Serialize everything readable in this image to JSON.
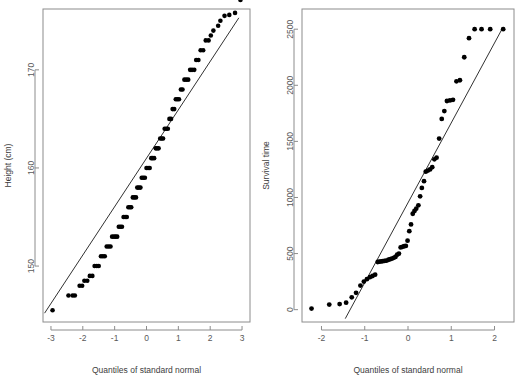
{
  "figure": {
    "background": "#ffffff",
    "point_color": "#000000",
    "axis_color": "#8c8c8c",
    "line_color": "#1a1a1a",
    "panels": 2
  },
  "chart_data": [
    {
      "type": "scatter",
      "name": "height-qqplot",
      "title": "",
      "xlabel": "Quantiles of standard normal",
      "ylabel": "Height (cm)",
      "xlim": [
        -3.25,
        3.25
      ],
      "ylim": [
        144.3,
        176.2
      ],
      "xticks": [
        -3,
        -2,
        -1,
        0,
        1,
        2,
        3
      ],
      "xticklabels": [
        "-3",
        "-2",
        "-1",
        "0",
        "1",
        "2",
        "3"
      ],
      "yticks": [
        150,
        160,
        170
      ],
      "yticklabels": [
        "150",
        "160",
        "170"
      ],
      "grid": false,
      "legend": null,
      "annotations": [],
      "reference_line": {
        "type": "qq-line",
        "x": [
          -3.2,
          2.9
        ],
        "y": [
          145.2,
          175.3
        ]
      },
      "x": [
        -2.95,
        -2.45,
        -2.32,
        -2.25,
        -2.1,
        -2.02,
        -1.95,
        -1.86,
        -1.78,
        -1.7,
        -1.63,
        -1.56,
        -1.5,
        -1.43,
        -1.37,
        -1.31,
        -1.25,
        -1.19,
        -1.13,
        -1.08,
        -1.02,
        -0.97,
        -0.92,
        -0.87,
        -0.82,
        -0.77,
        -0.72,
        -0.67,
        -0.62,
        -0.57,
        -0.52,
        -0.48,
        -0.43,
        -0.38,
        -0.33,
        -0.29,
        -0.24,
        -0.19,
        -0.15,
        -0.1,
        -0.05,
        0.0,
        0.05,
        0.1,
        0.15,
        0.19,
        0.24,
        0.29,
        0.33,
        0.38,
        0.43,
        0.48,
        0.52,
        0.57,
        0.62,
        0.67,
        0.72,
        0.77,
        0.82,
        0.87,
        0.92,
        0.97,
        1.02,
        1.08,
        1.13,
        1.19,
        1.25,
        1.31,
        1.37,
        1.43,
        1.5,
        1.56,
        1.63,
        1.7,
        1.78,
        1.86,
        1.95,
        2.02,
        2.1,
        2.25,
        2.32,
        2.45,
        2.6,
        2.78,
        2.95
      ],
      "y": [
        145.5,
        147.0,
        147.0,
        147.0,
        148.0,
        148.0,
        148.5,
        148.5,
        149.0,
        149.0,
        150.0,
        150.0,
        150.0,
        151.0,
        151.0,
        151.0,
        152.0,
        152.0,
        152.0,
        153.0,
        153.0,
        153.0,
        153.0,
        154.0,
        154.0,
        154.0,
        155.0,
        155.0,
        155.0,
        156.0,
        156.0,
        156.0,
        157.0,
        157.0,
        157.0,
        158.0,
        158.0,
        158.0,
        159.0,
        159.0,
        159.0,
        160.0,
        160.0,
        160.0,
        161.0,
        161.0,
        161.0,
        162.0,
        162.0,
        162.0,
        163.0,
        163.0,
        163.0,
        164.0,
        164.0,
        164.0,
        165.0,
        165.0,
        166.0,
        166.0,
        167.0,
        167.0,
        167.0,
        168.0,
        168.0,
        169.0,
        169.0,
        169.0,
        170.0,
        170.0,
        170.0,
        171.0,
        171.0,
        172.0,
        172.0,
        173.0,
        173.0,
        173.5,
        174.0,
        174.5,
        175.0,
        175.5,
        175.6,
        175.8
      ]
    },
    {
      "type": "scatter",
      "name": "survival-time-qqplot",
      "title": "",
      "xlabel": "Quantiles of standard normal",
      "ylabel": "Survival time",
      "xlim": [
        -2.45,
        2.45
      ],
      "ylim": [
        -110,
        2680
      ],
      "xticks": [
        -2,
        -1,
        0,
        1,
        2
      ],
      "xticklabels": [
        "-2",
        "-1",
        "0",
        "1",
        "2"
      ],
      "yticks": [
        0,
        500,
        1000,
        1500,
        2000,
        2500
      ],
      "yticklabels": [
        "0",
        "500",
        "1000",
        "1500",
        "2000",
        "2500"
      ],
      "grid": false,
      "legend": null,
      "annotations": [],
      "reference_line": {
        "type": "qq-line",
        "x": [
          -1.45,
          2.2
        ],
        "y": [
          -80,
          2520
        ]
      },
      "x": [
        -2.23,
        -1.82,
        -1.58,
        -1.43,
        -1.3,
        -1.2,
        -1.1,
        -1.02,
        -0.95,
        -0.88,
        -0.82,
        -0.76,
        -0.7,
        -0.66,
        -0.62,
        -0.58,
        -0.54,
        -0.5,
        -0.45,
        -0.41,
        -0.37,
        -0.33,
        -0.29,
        -0.25,
        -0.21,
        -0.17,
        -0.13,
        -0.09,
        -0.05,
        -0.01,
        0.03,
        0.07,
        0.11,
        0.15,
        0.19,
        0.24,
        0.28,
        0.32,
        0.37,
        0.41,
        0.46,
        0.51,
        0.56,
        0.61,
        0.66,
        0.72,
        0.78,
        0.84,
        0.9,
        0.97,
        1.04,
        1.12,
        1.2,
        1.3,
        1.41,
        1.54,
        1.7,
        1.9,
        2.2
      ],
      "y": [
        10,
        45,
        50,
        62,
        110,
        150,
        215,
        250,
        272,
        290,
        300,
        312,
        425,
        428,
        430,
        432,
        435,
        437,
        445,
        450,
        455,
        462,
        470,
        490,
        500,
        555,
        560,
        565,
        568,
        615,
        700,
        760,
        855,
        880,
        900,
        930,
        1010,
        1085,
        1145,
        1230,
        1240,
        1250,
        1270,
        1340,
        1355,
        1525,
        1700,
        1770,
        1860,
        1865,
        1870,
        2035,
        2045,
        2250,
        2420,
        2500,
        2500,
        2500,
        2500
      ]
    }
  ]
}
